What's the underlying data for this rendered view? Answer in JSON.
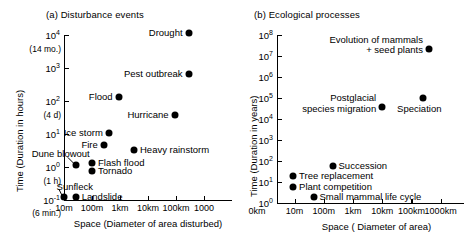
{
  "figure": {
    "panels": [
      {
        "id": "a",
        "title": "(a) Disturbance events",
        "xlabel": "Space  (Diameter of area disturbed)",
        "ylabel": "Time  (Duration in hours)",
        "yticks": [
          "4",
          "3",
          "2",
          "1",
          "0",
          "-1"
        ],
        "ytick_base": "10",
        "ysublabels": [
          "(14 mo.)",
          "(4 d)",
          "(1 h)",
          "(6 min.)"
        ],
        "xticks": [
          "10m",
          "100m",
          "1km",
          "10km",
          "100km",
          "1000"
        ],
        "points": [
          {
            "label": "Drought",
            "side": "left",
            "x_dec": 5.45,
            "y_dec": 4.05
          },
          {
            "label": "Pest outbreak",
            "side": "left",
            "x_dec": 5.45,
            "y_dec": 2.82
          },
          {
            "label": "Flood",
            "side": "left",
            "x_dec": 2.95,
            "y_dec": 2.12
          },
          {
            "label": "Hurricane",
            "side": "left",
            "x_dec": 4.95,
            "y_dec": 1.58
          },
          {
            "label": "Ice storm",
            "side": "left",
            "x_dec": 2.6,
            "y_dec": 1.02
          },
          {
            "label": "Fire",
            "side": "left",
            "x_dec": 2.42,
            "y_dec": 0.68
          },
          {
            "label": "Heavy rainstorm",
            "side": "right",
            "x_dec": 3.5,
            "y_dec": 0.52
          },
          {
            "label": "Flash flood",
            "side": "right",
            "x_dec": 2.0,
            "y_dec": 0.12
          },
          {
            "label": "Tornado",
            "side": "right",
            "x_dec": 2.0,
            "y_dec": -0.12
          },
          {
            "label": "Dune blowout",
            "side": "leader",
            "x_dec": 1.42,
            "y_dec": 0.05
          },
          {
            "label": "Landslide",
            "side": "right",
            "x_dec": 1.42,
            "y_dec": -0.92
          },
          {
            "label": "Sunfleck",
            "side": "leader",
            "x_dec": 1.0,
            "y_dec": -0.92
          }
        ]
      },
      {
        "id": "b",
        "title": "(b) Ecological processes",
        "xlabel": "Space  ( Diameter of area)",
        "ylabel": "Time  (Duration in years)",
        "yticks": [
          "8",
          "7",
          "6",
          "5",
          "4",
          "3",
          "2",
          "1",
          "0"
        ],
        "ytick_base": "10",
        "xticks_pre": "0km",
        "xticks": [
          "10m",
          "100m",
          "1km",
          "10km",
          "100km",
          "1000km"
        ],
        "points": [
          {
            "label": "Evolution of mammals\n    + seed plants",
            "side": "left",
            "x_dec": 5.6,
            "y_dec": 7.35
          },
          {
            "label": "Postglacial\nspecies migration",
            "side": "left",
            "x_dec": 4.0,
            "y_dec": 4.55
          },
          {
            "label": "Speciation",
            "side": "below",
            "x_dec": 5.4,
            "y_dec": 5.0
          },
          {
            "label": "Succession",
            "side": "right",
            "x_dec": 2.3,
            "y_dec": 1.78
          },
          {
            "label": "Tree replacement",
            "side": "right",
            "x_dec": 0.95,
            "y_dec": 1.3
          },
          {
            "label": "Plant competition",
            "side": "right",
            "x_dec": 0.95,
            "y_dec": 0.75
          },
          {
            "label": "Small mammal life cycle",
            "side": "right",
            "x_dec": 1.65,
            "y_dec": 0.28
          }
        ]
      }
    ]
  },
  "chart_data": [
    {
      "type": "scatter",
      "title": "(a) Disturbance events",
      "xlabel": "Space  (Diameter of area disturbed)",
      "ylabel": "Time  (Duration in hours)",
      "xscale": "log",
      "yscale": "log",
      "xlim": [
        "10m",
        "1000km"
      ],
      "ylim": [
        "1e-1",
        "1e4"
      ],
      "xtick_labels": [
        "10m",
        "100m",
        "1km",
        "10km",
        "100km",
        "1000"
      ],
      "ytick_labels": [
        "10^4",
        "10^3",
        "10^2",
        "10^1",
        "10^0",
        "10^-1"
      ],
      "ytick_annotations": [
        "(14 mo.)",
        "(4 d)",
        "(1 h)",
        "(6 min.)"
      ],
      "grid": false,
      "legend": "none",
      "points": [
        {
          "name": "Drought",
          "x_km": 300,
          "y_hours": 11000
        },
        {
          "name": "Pest outbreak",
          "x_km": 300,
          "y_hours": 660
        },
        {
          "name": "Flood",
          "x_km": 0.9,
          "y_hours": 130
        },
        {
          "name": "Hurricane",
          "x_km": 90,
          "y_hours": 38
        },
        {
          "name": "Ice storm",
          "x_km": 0.4,
          "y_hours": 10.5
        },
        {
          "name": "Fire",
          "x_km": 0.26,
          "y_hours": 4.8
        },
        {
          "name": "Heavy rainstorm",
          "x_km": 3.2,
          "y_hours": 3.3
        },
        {
          "name": "Flash flood",
          "x_km": 0.1,
          "y_hours": 1.3
        },
        {
          "name": "Tornado",
          "x_km": 0.1,
          "y_hours": 0.76
        },
        {
          "name": "Dune blowout",
          "x_km": 0.026,
          "y_hours": 1.1
        },
        {
          "name": "Landslide",
          "x_km": 0.026,
          "y_hours": 0.12
        },
        {
          "name": "Sunfleck",
          "x_km": 0.01,
          "y_hours": 0.12
        }
      ]
    },
    {
      "type": "scatter",
      "title": "(b) Ecological processes",
      "xlabel": "Space  ( Diameter of area)",
      "ylabel": "Time  (Duration in years)",
      "xscale": "log",
      "yscale": "log",
      "xlim": [
        "1m",
        "1000km"
      ],
      "ylim": [
        "1e0",
        "1e8"
      ],
      "xtick_labels": [
        "10m",
        "100m",
        "1km",
        "10km",
        "100km",
        "1000km"
      ],
      "ytick_labels": [
        "10^8",
        "10^7",
        "10^6",
        "10^5",
        "10^4",
        "10^3",
        "10^2",
        "10^1",
        "10^0"
      ],
      "grid": false,
      "legend": "none",
      "points": [
        {
          "name": "Evolution of mammals + seed plants",
          "x_km": 400,
          "y_years": 22000000
        },
        {
          "name": "Postglacial species migration",
          "x_km": 10,
          "y_years": 35000
        },
        {
          "name": "Speciation",
          "x_km": 250,
          "y_years": 100000
        },
        {
          "name": "Succession",
          "x_km": 0.2,
          "y_years": 60
        },
        {
          "name": "Tree replacement",
          "x_km": 0.009,
          "y_years": 20
        },
        {
          "name": "Plant competition",
          "x_km": 0.009,
          "y_years": 5.6
        },
        {
          "name": "Small mammal life cycle",
          "x_km": 0.045,
          "y_years": 1.9
        }
      ]
    }
  ]
}
